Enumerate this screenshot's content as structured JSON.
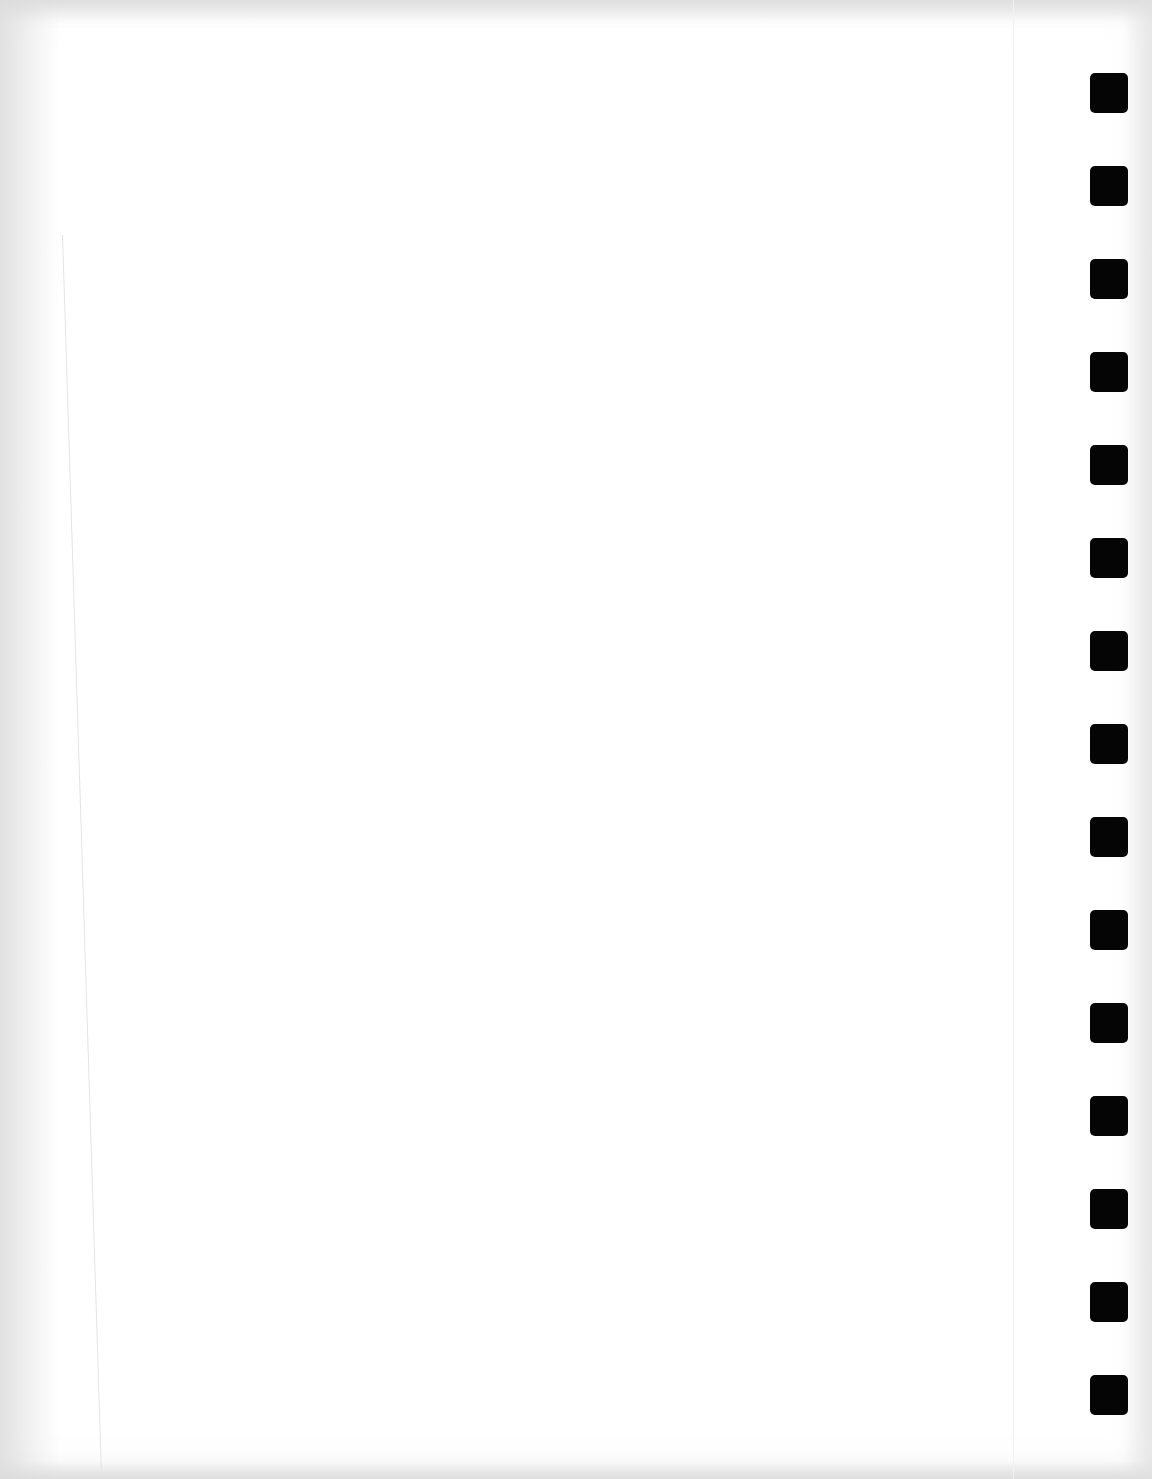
{
  "page": {
    "type": "scanned blank page",
    "text": "",
    "background_color": "#ffffff",
    "mark_color": "#050505"
  },
  "registration_marks": {
    "count": 15,
    "x": 1090,
    "width": 38,
    "height": 40,
    "positions_y": [
      73,
      166,
      259,
      352,
      445,
      538,
      631,
      724,
      817,
      910,
      1003,
      1096,
      1189,
      1282,
      1375
    ]
  }
}
